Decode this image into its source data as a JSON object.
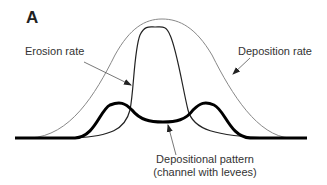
{
  "figure": {
    "panel_label": "A",
    "labels": {
      "erosion": "Erosion rate",
      "deposition": "Deposition rate",
      "pattern_line1": "Depositional pattern",
      "pattern_line2": "(channel with levees)"
    },
    "colors": {
      "deposition_curve": "#888888",
      "erosion_curve": "#222222",
      "pattern_curve": "#000000",
      "arrows": "#555555"
    }
  }
}
